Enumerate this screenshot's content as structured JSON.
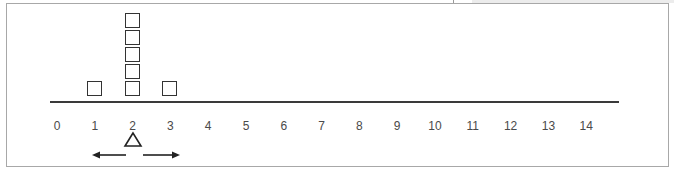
{
  "chart_data": {
    "type": "dot-plot",
    "title": "",
    "xlabel": "",
    "ylabel": "",
    "marker": "square",
    "xlim": [
      0,
      14
    ],
    "ticks": [
      0,
      1,
      2,
      3,
      4,
      5,
      6,
      7,
      8,
      9,
      10,
      11,
      12,
      13,
      14
    ],
    "tick_labels": [
      "0",
      "1",
      "2",
      "3",
      "4",
      "5",
      "6",
      "7",
      "8",
      "9",
      "10",
      "11",
      "12",
      "13",
      "14"
    ],
    "categories": [
      1,
      2,
      3
    ],
    "values": [
      1,
      5,
      1
    ],
    "annotations": [
      {
        "type": "triangle-marker",
        "at": 2,
        "meaning": "balance point / mean"
      },
      {
        "type": "arrow",
        "direction": "left",
        "from": 1.8,
        "to": 1.0
      },
      {
        "type": "arrow",
        "direction": "right",
        "from": 2.2,
        "to": 3.0
      }
    ],
    "grid": false,
    "legend": null
  },
  "colors": {
    "frame": "#a8a8a8",
    "axis": "#3a3a3a",
    "marker": "#333333",
    "tick_text": "#4a4a4a"
  }
}
